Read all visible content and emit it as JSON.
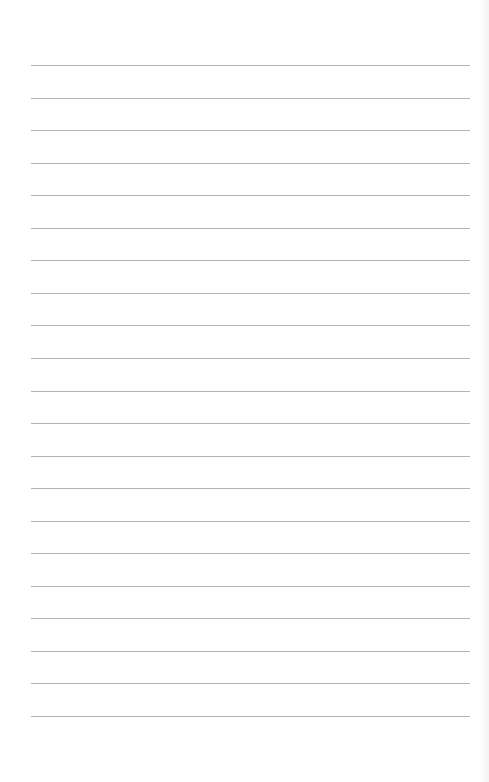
{
  "page": {
    "type": "blank-lined-sheet",
    "line_count": 21,
    "line_color": "#b4b4b4",
    "background_color": "#ffffff",
    "first_line_y": 65,
    "line_spacing": 32.55,
    "line_left": 31,
    "line_width": 439
  }
}
